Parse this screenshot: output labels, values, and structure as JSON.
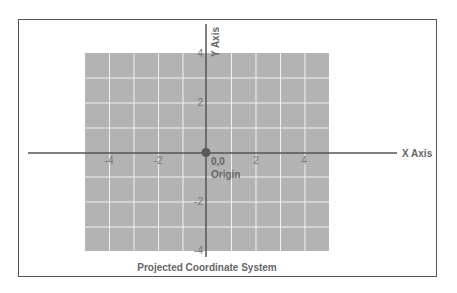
{
  "diagram": {
    "title": "Projected Coordinate System",
    "x_axis_label": "X Axis",
    "y_axis_label": "Y Axis",
    "origin_label": "Origin",
    "origin_coords": "0,0",
    "x_ticks": [
      {
        "value": -4,
        "label": "-4"
      },
      {
        "value": -2,
        "label": "-2"
      },
      {
        "value": 2,
        "label": "2"
      },
      {
        "value": 4,
        "label": "4"
      }
    ],
    "y_ticks": [
      {
        "value": 4,
        "label": "4"
      },
      {
        "value": 2,
        "label": "2"
      },
      {
        "value": -2,
        "label": "-2"
      },
      {
        "value": -4,
        "label": "-4"
      }
    ],
    "grid_range": {
      "x": [
        -5,
        5
      ],
      "y": [
        -4,
        4
      ]
    },
    "colors": {
      "grid_fill": "#b3b3b3",
      "grid_lines": "#ffffff",
      "axis": "#555555",
      "border": "#555555",
      "text": "#666666"
    }
  }
}
